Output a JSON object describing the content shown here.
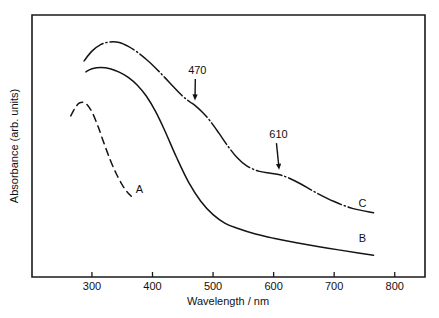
{
  "chart_data": {
    "type": "line",
    "title": "",
    "xlabel": "Wavelength / nm",
    "ylabel": "Absorbance (arb. units)",
    "xlim": [
      201,
      850
    ],
    "ylim": [
      0,
      1
    ],
    "xticks": [
      300,
      400,
      500,
      600,
      700,
      800
    ],
    "xticklabels": [
      "300",
      "400",
      "500",
      "600",
      "700",
      "800"
    ],
    "yticks": [],
    "yticklabels": [],
    "grid": false,
    "legend": "inline-curve-labels",
    "series": [
      {
        "name": "A",
        "label": "A",
        "linestyle": "dashed",
        "color": "#141414",
        "x": [
          265,
          272,
          280,
          290,
          300,
          310,
          320,
          330,
          340,
          350,
          358,
          365
        ],
        "y": [
          0.615,
          0.645,
          0.665,
          0.662,
          0.63,
          0.575,
          0.51,
          0.448,
          0.395,
          0.352,
          0.325,
          0.308
        ]
      },
      {
        "name": "B",
        "label": "B",
        "linestyle": "solid",
        "color": "#141414",
        "x": [
          290,
          300,
          315,
          330,
          345,
          360,
          375,
          390,
          405,
          420,
          440,
          460,
          480,
          500,
          520,
          540,
          570,
          600,
          640,
          690,
          740,
          765
        ],
        "y": [
          0.783,
          0.795,
          0.8,
          0.795,
          0.782,
          0.762,
          0.732,
          0.69,
          0.632,
          0.56,
          0.455,
          0.36,
          0.288,
          0.238,
          0.205,
          0.186,
          0.164,
          0.148,
          0.13,
          0.11,
          0.092,
          0.083
        ]
      },
      {
        "name": "C",
        "label": "C",
        "linestyle": "dashdot",
        "color": "#141414",
        "x": [
          287,
          300,
          315,
          330,
          345,
          360,
          375,
          390,
          405,
          420,
          435,
          450,
          462,
          470,
          482,
          495,
          510,
          525,
          540,
          555,
          575,
          595,
          610,
          625,
          645,
          670,
          700,
          730,
          765
        ],
        "y": [
          0.825,
          0.862,
          0.888,
          0.897,
          0.895,
          0.88,
          0.858,
          0.83,
          0.798,
          0.762,
          0.725,
          0.69,
          0.668,
          0.655,
          0.63,
          0.596,
          0.548,
          0.498,
          0.455,
          0.425,
          0.404,
          0.396,
          0.39,
          0.378,
          0.355,
          0.322,
          0.288,
          0.262,
          0.245
        ]
      }
    ],
    "annotations": [
      {
        "text": "470",
        "x": 470,
        "y": 0.655,
        "label_x": 474,
        "label_y": 0.775,
        "arrow": true
      },
      {
        "text": "610",
        "x": 610,
        "y": 0.39,
        "label_x": 608,
        "label_y": 0.53,
        "arrow": true
      }
    ]
  },
  "figure": {
    "background": "#ffffff",
    "frame_color": "#1a1a1a",
    "curve_color": "#141414"
  }
}
